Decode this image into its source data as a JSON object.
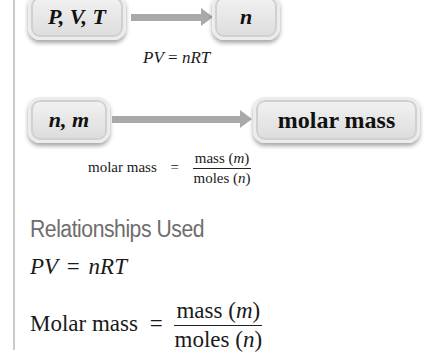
{
  "diagram": {
    "row1": {
      "from_box": "P, V, T",
      "to_box": "n",
      "relation": {
        "lhs": "PV",
        "eq": "=",
        "rhs": "nRT"
      }
    },
    "row2": {
      "from_box": "n, m",
      "to_box": "molar mass",
      "relation": {
        "lhs": "molar mass",
        "eq": "=",
        "numerator_word": "mass",
        "numerator_var": "m",
        "denominator_word": "moles",
        "denominator_var": "n"
      }
    }
  },
  "relationships": {
    "heading": "Relationships Used",
    "items": [
      {
        "lhs": "PV",
        "eq": "=",
        "rhs": "nRT"
      },
      {
        "lhs": "Molar mass",
        "eq": "=",
        "numerator_word": "mass",
        "numerator_var": "m",
        "denominator_word": "moles",
        "denominator_var": "n"
      }
    ]
  },
  "colors": {
    "box_fill": "#e3e3e3",
    "arrow": "#a9a9a9",
    "heading": "#6d6d6d",
    "rule": "#c9c9c9"
  }
}
